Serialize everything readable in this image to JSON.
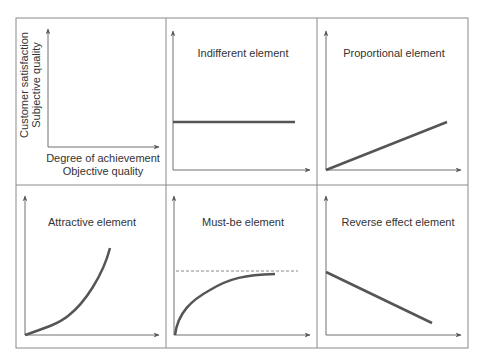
{
  "diagram": {
    "type": "kano-model-grid",
    "colors": {
      "border": "#8a8a8a",
      "axis": "#707070",
      "curve": "#555555",
      "dashed": "#888888",
      "text": "#333333"
    },
    "legend_panel": {
      "y_label_line1": "Customer satisfaction",
      "y_label_line2": "Subjective quality",
      "x_label_line1": "Degree of achievement",
      "x_label_line2": "Objective quality"
    },
    "panels": [
      {
        "id": "indifferent",
        "title": "Indifferent element",
        "shape": "horizontal-line"
      },
      {
        "id": "proportional",
        "title": "Proportional element",
        "shape": "rising-line"
      },
      {
        "id": "attractive",
        "title": "Attractive element",
        "shape": "exponential-curve"
      },
      {
        "id": "must-be",
        "title": "Must-be element",
        "shape": "saturating-curve-with-dashed-ceiling"
      },
      {
        "id": "reverse",
        "title": "Reverse effect element",
        "shape": "falling-line"
      }
    ]
  }
}
